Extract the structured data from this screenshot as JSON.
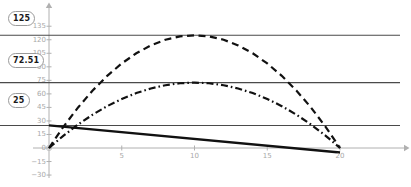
{
  "chart_data": {
    "type": "line",
    "title": "",
    "xlabel": "",
    "ylabel": "",
    "xlim": [
      -1.2,
      22.5
    ],
    "ylim": [
      -36,
      140
    ],
    "grid": false,
    "legend_position": "none",
    "x_ticks": [
      5,
      10,
      15,
      20
    ],
    "y_ticks": [
      135,
      120,
      105,
      90,
      75,
      60,
      45,
      30,
      15,
      0,
      -15,
      -30
    ],
    "axis_color": "#b0b0b0",
    "series": [
      {
        "name": "upper-parabola",
        "style": "dashed",
        "color": "#111111",
        "x": [
          0,
          1,
          2,
          3,
          4,
          5,
          6,
          7,
          8,
          9,
          10,
          11,
          12,
          13,
          14,
          15,
          16,
          17,
          18,
          19,
          20
        ],
        "values": [
          0,
          23.75,
          45,
          63.75,
          80,
          93.75,
          105,
          113.75,
          120,
          123.75,
          125,
          123.75,
          120,
          113.75,
          105,
          93.75,
          80,
          63.75,
          45,
          23.75,
          0
        ],
        "peak_x": 10,
        "peak_y": 125
      },
      {
        "name": "lower-parabola",
        "style": "dashdot",
        "color": "#111111",
        "x": [
          0,
          1,
          2,
          3,
          4,
          5,
          6,
          7,
          8,
          9,
          10,
          11,
          12,
          13,
          14,
          15,
          16,
          17,
          18,
          19,
          20
        ],
        "values": [
          0,
          13.78,
          26.1,
          36.98,
          46.41,
          54.38,
          60.91,
          65.99,
          69.61,
          71.79,
          72.51,
          71.79,
          69.61,
          65.99,
          60.91,
          54.38,
          46.41,
          36.98,
          26.1,
          13.78,
          0
        ],
        "peak_x": 10,
        "peak_y": 72.51
      },
      {
        "name": "descending-line",
        "style": "solid",
        "color": "#111111",
        "x": [
          0,
          20
        ],
        "values": [
          25,
          -5
        ],
        "slope": -1.5,
        "intercept": 25
      }
    ],
    "reference_lines": [
      {
        "name": "ref-125",
        "value": 125,
        "label": "125"
      },
      {
        "name": "ref-72.51",
        "value": 72.51,
        "label": "72.51"
      },
      {
        "name": "ref-25",
        "value": 25,
        "label": "25"
      }
    ]
  }
}
